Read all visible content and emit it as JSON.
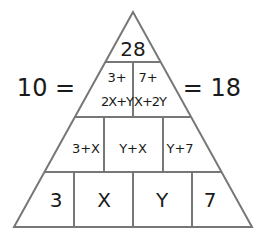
{
  "pyramid": {
    "top": "28",
    "row2": [
      {
        "line1": "3+",
        "line2": "2X+Y"
      },
      {
        "line1": "7+",
        "line2": "X+2Y"
      }
    ],
    "row3": [
      "3+X",
      "Y+X",
      "Y+7"
    ],
    "base": [
      "3",
      "X",
      "Y",
      "7"
    ]
  },
  "equations": {
    "left": "10 =",
    "right": "= 18"
  },
  "colors": {
    "stroke": "#777777",
    "text": "#1a1a1a"
  }
}
